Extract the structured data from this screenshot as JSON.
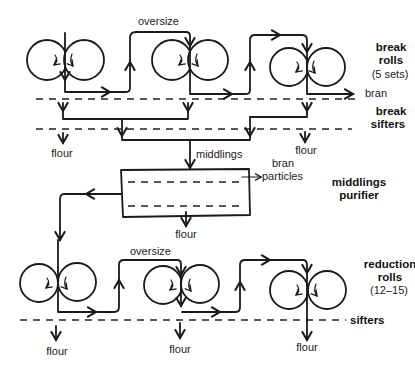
{
  "diagram": {
    "stages": {
      "break_rolls": {
        "title_line1": "break",
        "title_line2": "rolls",
        "count": "(5 sets)"
      },
      "break_sifters": {
        "title_line1": "break",
        "title_line2": "sifters"
      },
      "middlings_purifier": {
        "title_line1": "middlings",
        "title_line2": "purifier"
      },
      "reduction_rolls": {
        "title_line1": "reduction",
        "title_line2": "rolls",
        "count": "(12–15)"
      },
      "sifters": {
        "title": "sifters"
      }
    },
    "labels": {
      "oversize_top": "oversize",
      "oversize_bottom": "oversize",
      "bran": "bran",
      "middlings": "middlings",
      "bran_particles_line1": "bran",
      "bran_particles_line2": "particles",
      "flour": "flour"
    },
    "flour_outputs": [
      {
        "stage": "break_sifters",
        "position": "left",
        "label": "flour"
      },
      {
        "stage": "break_sifters",
        "position": "right",
        "label": "flour"
      },
      {
        "stage": "middlings_purifier",
        "position": "bottom",
        "label": "flour"
      },
      {
        "stage": "reduction_sifters",
        "position": "left",
        "label": "flour"
      },
      {
        "stage": "reduction_sifters",
        "position": "middle",
        "label": "flour"
      },
      {
        "stage": "reduction_sifters",
        "position": "right",
        "label": "flour"
      }
    ],
    "colors": {
      "ink": "#1a1a1a",
      "background": "#ffffff"
    }
  }
}
